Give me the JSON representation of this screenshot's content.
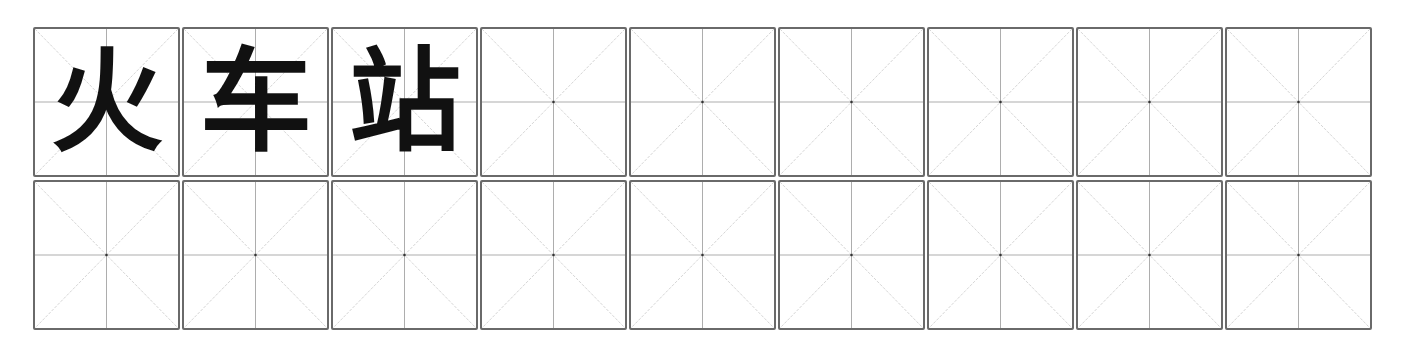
{
  "worksheet": {
    "type": "mi-zi-ge character practice grid",
    "rows": 2,
    "columns": 9,
    "row1": [
      "火",
      "车",
      "站",
      "",
      "",
      "",
      "",
      "",
      ""
    ],
    "row2": [
      "",
      "",
      "",
      "",
      "",
      "",
      "",
      "",
      ""
    ],
    "colors": {
      "border": "#6a6a6a",
      "guide": "#b0b0b0",
      "text": "#111111"
    }
  }
}
